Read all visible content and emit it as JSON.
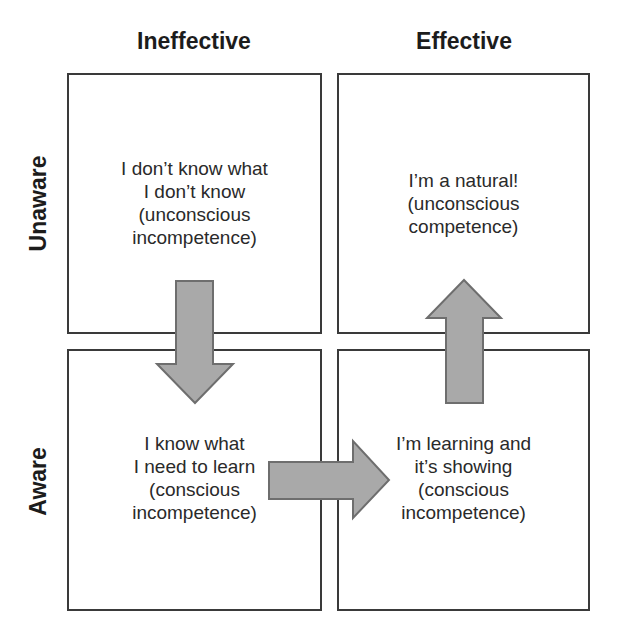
{
  "columns": [
    {
      "label": "Ineffective"
    },
    {
      "label": "Effective"
    }
  ],
  "rows": [
    {
      "label": "Unaware"
    },
    {
      "label": "Aware"
    }
  ],
  "quadrants": {
    "top_left": {
      "lines": [
        "I don’t know what",
        "I don’t know",
        "(unconscious",
        "incompetence)"
      ]
    },
    "top_right": {
      "lines": [
        "I’m a natural!",
        "(unconscious",
        "competence)"
      ]
    },
    "bottom_left": {
      "lines": [
        "I know what",
        "I need to learn",
        "(conscious",
        "incompetence)"
      ]
    },
    "bottom_right": {
      "lines": [
        "I’m learning and",
        "it’s showing",
        "(conscious",
        "incompetence)"
      ]
    }
  },
  "arrows": [
    {
      "from": "top_left",
      "to": "bottom_left",
      "direction": "down"
    },
    {
      "from": "bottom_left",
      "to": "bottom_right",
      "direction": "right"
    },
    {
      "from": "bottom_right",
      "to": "top_right",
      "direction": "up"
    }
  ],
  "colors": {
    "border": "#3a3a3a",
    "arrow_fill": "#a9a9a9",
    "arrow_stroke": "#6e6e6e"
  }
}
